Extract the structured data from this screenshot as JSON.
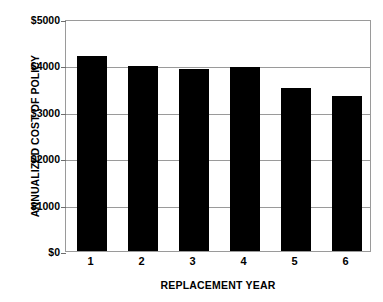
{
  "chart_data": {
    "type": "bar",
    "title": "",
    "xlabel": "REPLACEMENT YEAR",
    "ylabel": "ANNUALIZED COST OF POLICY",
    "categories": [
      "1",
      "2",
      "3",
      "4",
      "5",
      "6"
    ],
    "values": [
      4200,
      3990,
      3920,
      3960,
      3510,
      3340
    ],
    "ylim": [
      0,
      5000
    ],
    "y_ticks": [
      0,
      1000,
      2000,
      3000,
      4000,
      5000
    ],
    "y_tick_labels": [
      "$0",
      "$1000",
      "$2000",
      "$3000",
      "$4000",
      "$5000"
    ],
    "grid": true,
    "legend": false,
    "bar_color": "#000000",
    "grid_color": "#9a9a9a",
    "background_color": "#ffffff"
  },
  "axes": {
    "y_title": "ANNUALIZED COST OF POLICY",
    "x_title": "REPLACEMENT YEAR"
  }
}
